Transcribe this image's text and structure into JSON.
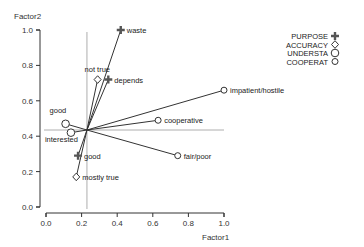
{
  "chart_data": {
    "type": "scatter",
    "title": "",
    "xlabel": "Factor1",
    "ylabel": "Factor2",
    "xlim": [
      0.0,
      1.0
    ],
    "ylim": [
      0.0,
      1.0
    ],
    "xticks": [
      "0.0",
      "0.2",
      "0.4",
      "0.6",
      "0.8",
      "1.0"
    ],
    "yticks": [
      "0.0",
      "0.2",
      "0.4",
      "0.6",
      "0.8",
      "1.0"
    ],
    "grid": false,
    "reference_lines": {
      "x": 0.23,
      "y": 0.435
    },
    "origin": {
      "x": 0.23,
      "y": 0.435
    },
    "legend": {
      "position": "top-right",
      "entries": [
        {
          "name": "PURPOSE",
          "marker": "plus"
        },
        {
          "name": "ACCURACY",
          "marker": "diamond"
        },
        {
          "name": "UNDERSTA",
          "marker": "circle"
        },
        {
          "name": "COOPERAT",
          "marker": "small-circle"
        }
      ]
    },
    "series": [
      {
        "name": "PURPOSE",
        "marker": "plus",
        "points": [
          {
            "label": "waste",
            "x": 0.42,
            "y": 1.0,
            "label_pos": "right"
          },
          {
            "label": "depends",
            "x": 0.35,
            "y": 0.72,
            "label_pos": "right"
          },
          {
            "label": "good",
            "x": 0.18,
            "y": 0.29,
            "label_pos": "right"
          }
        ]
      },
      {
        "name": "ACCURACY",
        "marker": "diamond",
        "points": [
          {
            "label": "not true",
            "x": 0.29,
            "y": 0.72,
            "label_pos": "above"
          },
          {
            "label": "mostly true",
            "x": 0.17,
            "y": 0.17,
            "label_pos": "right"
          }
        ]
      },
      {
        "name": "UNDERSTA",
        "marker": "circle",
        "points": [
          {
            "label": "good",
            "x": 0.11,
            "y": 0.47,
            "label_pos": "above-left"
          },
          {
            "label": "interested",
            "x": 0.14,
            "y": 0.42,
            "label_pos": "below-left"
          }
        ]
      },
      {
        "name": "COOPERAT",
        "marker": "small-circle",
        "points": [
          {
            "label": "impatient/hostile",
            "x": 1.0,
            "y": 0.66,
            "label_pos": "right"
          },
          {
            "label": "cooperative",
            "x": 0.63,
            "y": 0.49,
            "label_pos": "right"
          },
          {
            "label": "fair/poor",
            "x": 0.74,
            "y": 0.29,
            "label_pos": "right"
          }
        ]
      }
    ]
  }
}
